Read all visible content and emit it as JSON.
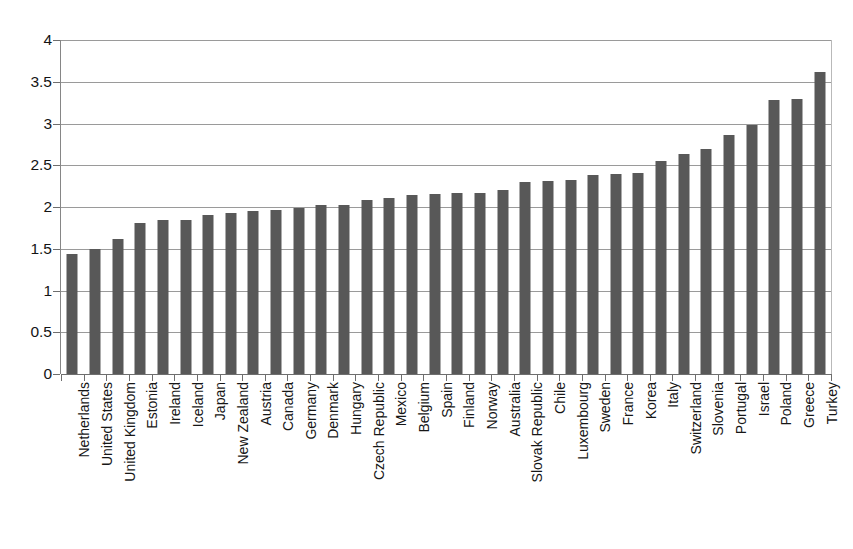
{
  "chart_data": {
    "type": "bar",
    "title": "",
    "subtitle": "",
    "xlabel": "",
    "ylabel": "",
    "ylim": [
      0,
      4
    ],
    "grid": true,
    "legend": false,
    "legend_position": "none",
    "bar_color": "#585858",
    "axis_color": "#6e6e6e",
    "gridline_color": "#9a9a9a",
    "background_color": "#ffffff",
    "y_ticks": [
      "0",
      "0.5",
      "1",
      "1.5",
      "2",
      "2.5",
      "3",
      "3.5",
      "4"
    ],
    "y_tick_values": [
      0,
      0.5,
      1,
      1.5,
      2,
      2.5,
      3,
      3.5,
      4
    ],
    "categories": [
      "Netherlands",
      "United States",
      "United Kingdom",
      "Estonia",
      "Ireland",
      "Iceland",
      "Japan",
      "New Zealand",
      "Austria",
      "Canada",
      "Germany",
      "Denmark",
      "Hungary",
      "Czech Republic",
      "Mexico",
      "Belgium",
      "Spain",
      "Finland",
      "Norway",
      "Australia",
      "Slovak Republic",
      "Chile",
      "Luxembourg",
      "Sweden",
      "France",
      "Korea",
      "Italy",
      "Switzerland",
      "Slovenia",
      "Portugal",
      "Israel",
      "Poland",
      "Greece",
      "Turkey"
    ],
    "values": [
      1.44,
      1.5,
      1.62,
      1.81,
      1.84,
      1.84,
      1.9,
      1.93,
      1.95,
      1.97,
      1.99,
      2.02,
      2.02,
      2.08,
      2.11,
      2.14,
      2.16,
      2.17,
      2.17,
      2.2,
      2.3,
      2.31,
      2.32,
      2.38,
      2.39,
      2.41,
      2.55,
      2.63,
      2.7,
      2.86,
      2.98,
      3.28,
      3.29,
      3.62
    ]
  }
}
